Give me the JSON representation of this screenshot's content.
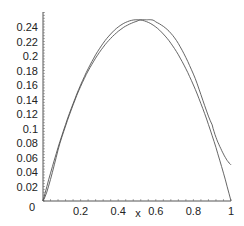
{
  "chart_data": {
    "type": "line",
    "title": "",
    "xlabel": "x",
    "ylabel": "",
    "xlim": [
      0,
      1
    ],
    "ylim": [
      0,
      0.26
    ],
    "grid": false,
    "legend": null,
    "x_ticks": [
      "0.2",
      "0.4",
      "0.6",
      "0.8",
      "1"
    ],
    "y_ticks": [
      "0",
      "0.02",
      "0.04",
      "0.06",
      "0.08",
      "0.1",
      "0.12",
      "0.14",
      "0.16",
      "0.18",
      "0.2",
      "0.22",
      "0.24"
    ],
    "series": [
      {
        "name": "exact",
        "x": [
          0,
          0.1,
          0.2,
          0.3,
          0.4,
          0.5,
          0.6,
          0.7,
          0.8,
          0.9,
          1.0
        ],
        "values": [
          0,
          0.09,
          0.16,
          0.21,
          0.24,
          0.25,
          0.24,
          0.21,
          0.16,
          0.09,
          0
        ]
      },
      {
        "name": "approximation",
        "x": [
          0,
          0.1,
          0.2,
          0.3,
          0.4,
          0.5,
          0.55,
          0.6,
          0.7,
          0.8,
          0.9,
          0.95,
          1.0
        ],
        "values": [
          0,
          0.088,
          0.158,
          0.205,
          0.234,
          0.248,
          0.25,
          0.247,
          0.225,
          0.175,
          0.105,
          0.07,
          0.05
        ]
      }
    ]
  },
  "axes": {
    "x_label": "x",
    "zero_label": "0"
  }
}
